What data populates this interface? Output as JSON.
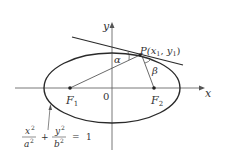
{
  "diagram": {
    "type": "ellipse-reflection-property",
    "axes": {
      "x_label": "x",
      "y_label": "y",
      "origin_label": "0"
    },
    "foci": [
      {
        "name": "F",
        "sub": "1"
      },
      {
        "name": "F",
        "sub": "2"
      }
    ],
    "point": {
      "label_prefix": "P(",
      "x_var": "x",
      "x_sub": "1",
      "sep": ", ",
      "y_var": "y",
      "y_sub": "1",
      "label_suffix": ")"
    },
    "angles": {
      "alpha": "α",
      "beta": "β"
    },
    "equation": {
      "num1": "x",
      "den1": "a",
      "num2": "y",
      "den2": "b",
      "exp": "2",
      "plus": "+",
      "equals": "=",
      "rhs": "1"
    },
    "colors": {
      "stroke": "#2a2a2a",
      "text": "#333333",
      "background": "#ffffff"
    }
  }
}
